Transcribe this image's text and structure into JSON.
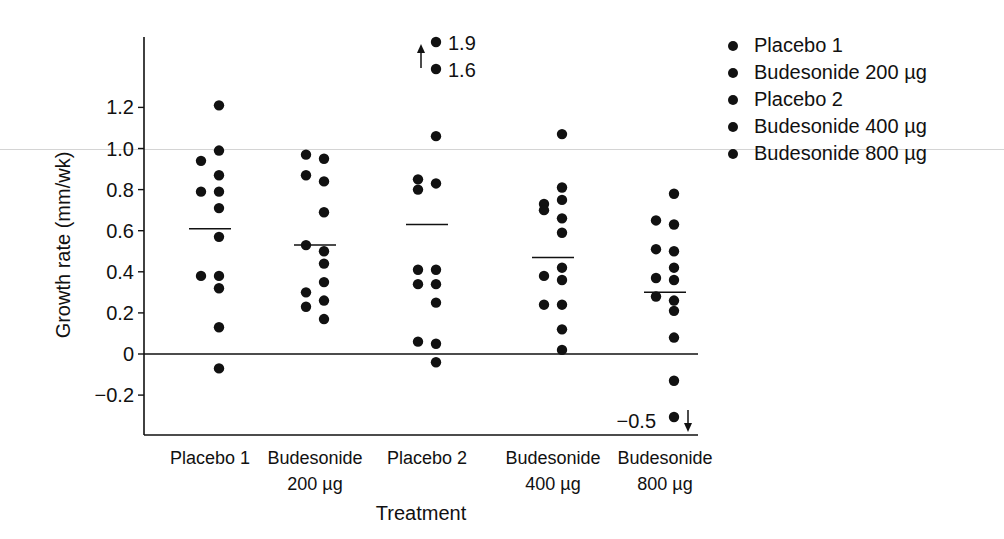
{
  "chart_data": {
    "type": "scatter",
    "title": "",
    "xlabel": "Treatment",
    "ylabel": "Growth rate (mm/wk)",
    "ylim": [
      -0.4,
      1.55
    ],
    "yticks": [
      -0.2,
      0,
      0.2,
      0.4,
      0.6,
      0.8,
      1.0,
      1.2
    ],
    "ytick_labels": [
      "−0.2",
      "0",
      "0.2",
      "0.4",
      "0.6",
      "0.8",
      "1.0",
      "1.2"
    ],
    "grid": false,
    "reference_line": 0,
    "legend_position": "right",
    "categories": [
      {
        "line1": "Placebo 1",
        "line2": ""
      },
      {
        "line1": "Budesonide",
        "line2": "200 µg"
      },
      {
        "line1": "Placebo 2",
        "line2": ""
      },
      {
        "line1": "Budesonide",
        "line2": "400 µg"
      },
      {
        "line1": "Budesonide",
        "line2": "800 µg"
      }
    ],
    "series": [
      {
        "name": "Placebo 1",
        "mean": 0.61,
        "points_left": [
          0.94,
          0.79,
          0.38
        ],
        "points_right": [
          1.21,
          0.99,
          0.87,
          0.79,
          0.71,
          0.57,
          0.38,
          0.32,
          0.13,
          -0.07
        ]
      },
      {
        "name": "Budesonide 200 µg",
        "mean": 0.53,
        "points_left": [
          0.97,
          0.87,
          0.53,
          0.3,
          0.23
        ],
        "points_right": [
          0.95,
          0.84,
          0.69,
          0.5,
          0.44,
          0.35,
          0.26,
          0.17
        ]
      },
      {
        "name": "Placebo 2",
        "mean": 0.63,
        "points_left": [
          0.85,
          0.8,
          0.41,
          0.34,
          0.06
        ],
        "points_right": [
          1.06,
          0.83,
          0.41,
          0.34,
          0.25,
          0.05,
          -0.04
        ],
        "off_scale_high": [
          1.9,
          1.6
        ]
      },
      {
        "name": "Budesonide 400 µg",
        "mean": 0.47,
        "points_left": [
          0.73,
          0.7,
          0.38,
          0.24
        ],
        "points_right": [
          1.07,
          0.81,
          0.75,
          0.66,
          0.59,
          0.42,
          0.36,
          0.24,
          0.12,
          0.02
        ]
      },
      {
        "name": "Budesonide 800 µg",
        "mean": 0.3,
        "points_left": [
          0.65,
          0.51,
          0.37,
          0.28
        ],
        "points_right": [
          0.78,
          0.63,
          0.5,
          0.42,
          0.36,
          0.26,
          0.21,
          0.08,
          -0.13
        ],
        "off_scale_low": [
          -0.5
        ]
      }
    ],
    "annotations": [
      {
        "text": "1.9",
        "series": "Placebo 2",
        "direction": "up"
      },
      {
        "text": "1.6",
        "series": "Placebo 2",
        "direction": "up"
      },
      {
        "text": "−0.5",
        "series": "Budesonide 800 µg",
        "direction": "down"
      }
    ]
  },
  "legend": {
    "items": [
      {
        "label": "Placebo 1"
      },
      {
        "label": "Budesonide 200 µg"
      },
      {
        "label": "Placebo 2"
      },
      {
        "label": "Budesonide 400 µg"
      },
      {
        "label": "Budesonide 800 µg"
      }
    ]
  }
}
